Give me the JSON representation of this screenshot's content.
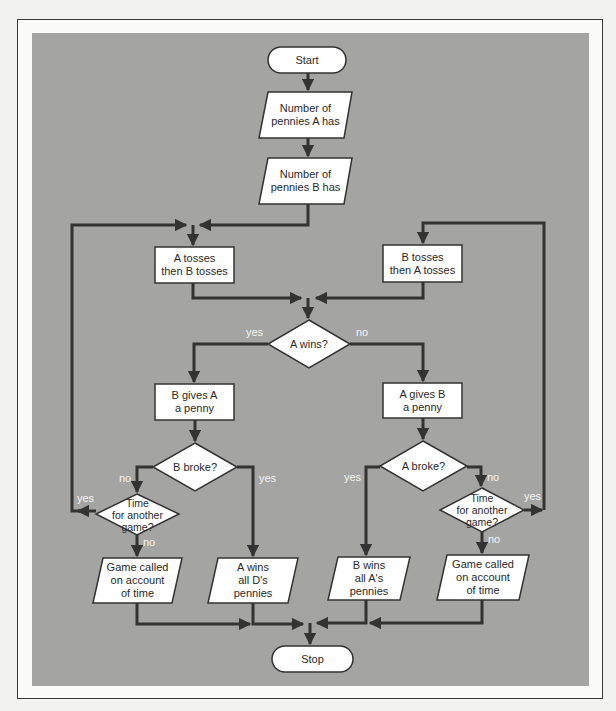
{
  "diagram": {
    "type": "flowchart",
    "title": "",
    "colors": {
      "background": "#f2f2f0",
      "panel": "#a4a4a2",
      "shape_fill": "#ffffff",
      "line": "#333333",
      "label_text": "#f4f4f2"
    },
    "nodes": {
      "start": {
        "shape": "terminator",
        "text": "Start"
      },
      "input_a": {
        "shape": "parallelogram",
        "text": "Number of\npennies A has"
      },
      "input_b": {
        "shape": "parallelogram",
        "text": "Number of\npennies B has"
      },
      "a_tosses": {
        "shape": "process",
        "text": "A tosses\nthen B tosses"
      },
      "b_tosses": {
        "shape": "process",
        "text": "B tosses\nthen A tosses"
      },
      "a_wins": {
        "shape": "decision",
        "text": "A wins?"
      },
      "b_gives_a": {
        "shape": "process",
        "text": "B gives A\na penny"
      },
      "a_gives_b": {
        "shape": "process",
        "text": "A gives B\na penny"
      },
      "b_broke": {
        "shape": "decision",
        "text": "B broke?"
      },
      "a_broke": {
        "shape": "decision",
        "text": "A broke?"
      },
      "time_left": {
        "shape": "decision",
        "text": "Time\nfor another\ngame?"
      },
      "time_right": {
        "shape": "decision",
        "text": "Time\nfor another\ngame?"
      },
      "game_called_left": {
        "shape": "parallelogram",
        "text": "Game called\non account\nof time"
      },
      "a_wins_all": {
        "shape": "parallelogram",
        "text": "A wins\nall D's\npennies"
      },
      "b_wins_all": {
        "shape": "parallelogram",
        "text": "B wins\nall A's\npennies"
      },
      "game_called_right": {
        "shape": "parallelogram",
        "text": "Game called\non account\nof time"
      },
      "stop": {
        "shape": "terminator",
        "text": "Stop"
      }
    },
    "edge_labels": {
      "a_wins_yes": "yes",
      "a_wins_no": "no",
      "b_broke_no": "no",
      "b_broke_yes": "yes",
      "time_left_yes": "yes",
      "time_left_no": "no",
      "a_broke_yes": "yes",
      "a_broke_no": "no",
      "time_right_yes": "yes",
      "time_right_no": "no"
    },
    "edges": [
      {
        "from": "start",
        "to": "input_a"
      },
      {
        "from": "input_a",
        "to": "input_b"
      },
      {
        "from": "input_b",
        "to": "a_tosses"
      },
      {
        "from": "a_tosses",
        "to": "a_wins"
      },
      {
        "from": "b_tosses",
        "to": "a_wins"
      },
      {
        "from": "a_wins",
        "to": "b_gives_a",
        "label": "yes"
      },
      {
        "from": "a_wins",
        "to": "a_gives_b",
        "label": "no"
      },
      {
        "from": "b_gives_a",
        "to": "b_broke"
      },
      {
        "from": "a_gives_b",
        "to": "a_broke"
      },
      {
        "from": "b_broke",
        "to": "time_left",
        "label": "no"
      },
      {
        "from": "b_broke",
        "to": "a_wins_all",
        "label": "yes"
      },
      {
        "from": "time_left",
        "to": "a_tosses",
        "label": "yes"
      },
      {
        "from": "time_left",
        "to": "game_called_left",
        "label": "no"
      },
      {
        "from": "a_broke",
        "to": "b_wins_all",
        "label": "yes"
      },
      {
        "from": "a_broke",
        "to": "time_right",
        "label": "no"
      },
      {
        "from": "time_right",
        "to": "b_tosses",
        "label": "yes"
      },
      {
        "from": "time_right",
        "to": "game_called_right",
        "label": "no"
      },
      {
        "from": "game_called_left",
        "to": "stop"
      },
      {
        "from": "a_wins_all",
        "to": "stop"
      },
      {
        "from": "b_wins_all",
        "to": "stop"
      },
      {
        "from": "game_called_right",
        "to": "stop"
      }
    ]
  }
}
